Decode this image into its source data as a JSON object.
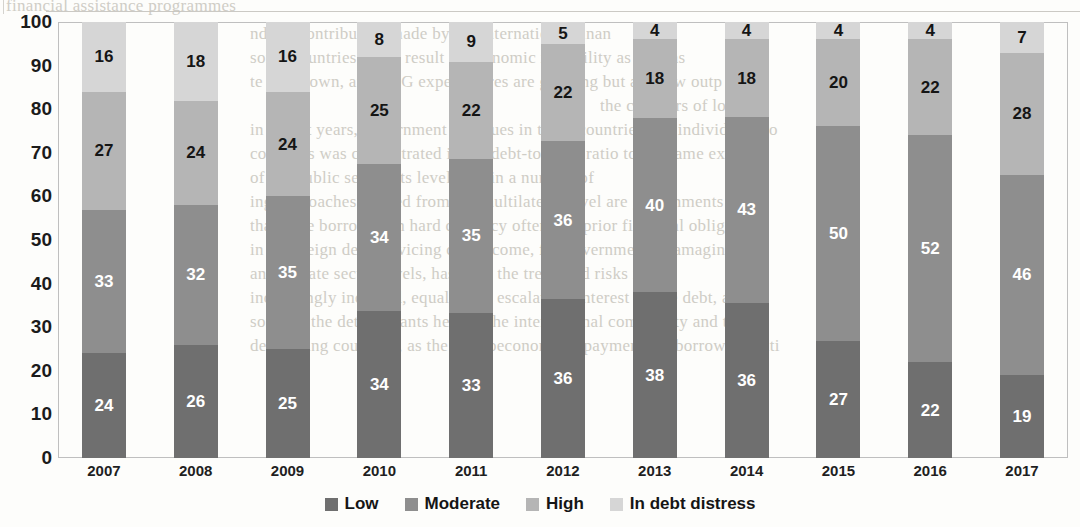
{
  "chart_data": {
    "type": "bar",
    "subtype": "stacked-100-percent",
    "title": "",
    "xlabel": "",
    "ylabel": "",
    "ylim": [
      0,
      100
    ],
    "ytick_step": 10,
    "yticks": [
      100,
      90,
      80,
      70,
      60,
      50,
      40,
      30,
      20,
      10,
      0
    ],
    "grid": false,
    "legend_position": "bottom-center",
    "stack_order_bottom_to_top": [
      "Low",
      "Moderate",
      "High",
      "In debt distress"
    ],
    "categories": [
      "2007",
      "2008",
      "2009",
      "2010",
      "2011",
      "2012",
      "2013",
      "2014",
      "2015",
      "2016",
      "2017"
    ],
    "series": [
      {
        "name": "Low",
        "color": "#6f6f6f",
        "label_color": "#ffffff",
        "values": [
          24,
          26,
          25,
          34,
          33,
          36,
          38,
          36,
          27,
          22,
          19
        ]
      },
      {
        "name": "Moderate",
        "color": "#8e8e8e",
        "label_color": "#ffffff",
        "values": [
          33,
          32,
          35,
          34,
          35,
          36,
          40,
          43,
          50,
          52,
          46
        ]
      },
      {
        "name": "High",
        "color": "#b5b5b5",
        "label_color": "#151515",
        "values": [
          27,
          24,
          24,
          25,
          22,
          22,
          18,
          18,
          20,
          22,
          28
        ]
      },
      {
        "name": "In debt distress",
        "color": "#d6d6d6",
        "label_color": "#151515",
        "values": [
          16,
          18,
          16,
          8,
          9,
          5,
          4,
          4,
          4,
          4,
          7
        ]
      }
    ]
  },
  "legend": {
    "items": [
      {
        "label": "Low",
        "color": "#6f6f6f"
      },
      {
        "label": "Moderate",
        "color": "#8e8e8e"
      },
      {
        "label": "High",
        "color": "#b5b5b5"
      },
      {
        "label": "In debt distress",
        "color": "#d6d6d6"
      }
    ]
  },
  "scan_artifacts": {
    "bleed_lines": [
      {
        "text": "financial assistance programmes",
        "x": 6,
        "y": -4
      },
      {
        "text": "nd the contribution made by the international finan",
        "x": 250,
        "y": 24
      },
      {
        "text": "some countries could result in economic instability as well as",
        "x": 250,
        "y": 48
      },
      {
        "text": "te slowdown, and SDG expenditures are growing but are now outp",
        "x": 250,
        "y": 72
      },
      {
        "text": "the creditors of low",
        "x": 600,
        "y": 96
      },
      {
        "text": "in recent years, government revenues in these countries and individual gro",
        "x": 250,
        "y": 120
      },
      {
        "text": "countries was concentrated in the debt-to-GDP ratio to the same exte",
        "x": 250,
        "y": 144
      },
      {
        "text": "of the public sector, its level, and in a number of",
        "x": 250,
        "y": 168
      },
      {
        "text": "ing approaches needed from the multilateral level are governments and",
        "x": 250,
        "y": 192
      },
      {
        "text": "that have borrowed in hard currency often and prior financial obligation",
        "x": 250,
        "y": 216
      },
      {
        "text": "in sovereign debt servicing can become, for governments, damaging stab",
        "x": 250,
        "y": 240
      },
      {
        "text": "and private sector levels, has been the trend and risks in",
        "x": 250,
        "y": 264
      },
      {
        "text": "increasingly indebted, equally can escalate of interest on the debt, and",
        "x": 250,
        "y": 288
      },
      {
        "text": "some of the determinants help of the international community and the pri",
        "x": 250,
        "y": 312
      },
      {
        "text": "developing countries, as the macroeconomic repayments or borrow conditi",
        "x": 250,
        "y": 336
      }
    ]
  }
}
